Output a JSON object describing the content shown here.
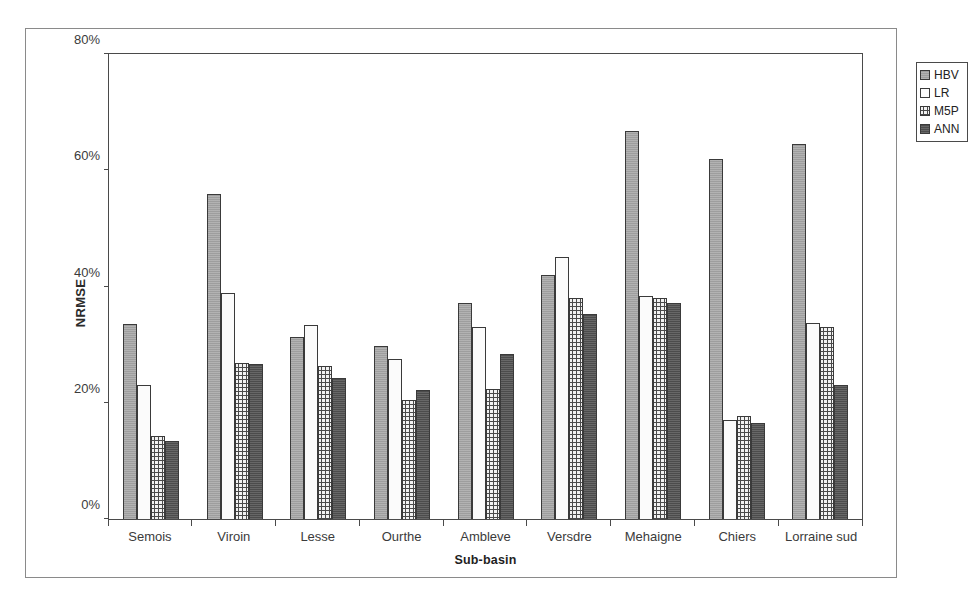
{
  "chart_data": {
    "type": "bar",
    "title": "",
    "xlabel": "Sub-basin",
    "ylabel": "NRMSE",
    "ylim": [
      0,
      80
    ],
    "y_unit": "%",
    "y_ticks": [
      "0%",
      "20%",
      "40%",
      "60%",
      "80%"
    ],
    "y_tick_values": [
      0,
      20,
      40,
      60,
      80
    ],
    "grid": false,
    "legend_position": "top-right",
    "categories": [
      "Semois",
      "Viroin",
      "Lesse",
      "Ourthe",
      "Ambleve",
      "Versdre",
      "Mehaigne",
      "Chiers",
      "Lorraine sud"
    ],
    "series": [
      {
        "name": "HBV",
        "color": "#a6a6a6",
        "pattern": "solid-gray",
        "values": [
          33.5,
          56.0,
          31.3,
          29.8,
          37.2,
          42.0,
          66.8,
          62.0,
          64.5
        ]
      },
      {
        "name": "LR",
        "color": "#fbfbfb",
        "pattern": "white",
        "values": [
          23.0,
          38.8,
          33.3,
          27.5,
          33.0,
          45.0,
          38.4,
          17.0,
          33.8
        ]
      },
      {
        "name": "M5P",
        "color": "#f2f2f2",
        "pattern": "stippled",
        "values": [
          14.3,
          26.8,
          26.3,
          20.5,
          22.4,
          38.0,
          38.0,
          17.8,
          33.0
        ]
      },
      {
        "name": "ANN",
        "color": "#565656",
        "pattern": "dark-gray",
        "values": [
          13.4,
          26.7,
          24.3,
          22.2,
          28.4,
          35.3,
          37.2,
          16.6,
          23.0
        ]
      }
    ]
  },
  "legend": {
    "items": [
      {
        "label": "HBV",
        "swatch_class": "series-hbv"
      },
      {
        "label": "LR",
        "swatch_class": "series-lr"
      },
      {
        "label": "M5P",
        "swatch_class": "series-m5p"
      },
      {
        "label": "ANN",
        "swatch_class": "series-ann"
      }
    ]
  }
}
